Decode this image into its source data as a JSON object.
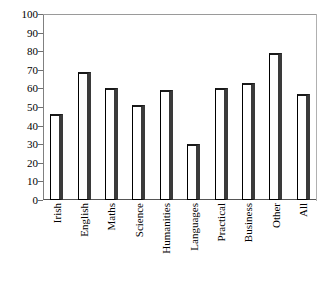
{
  "figure": {
    "caption_remnant": ""
  },
  "chart_data": {
    "type": "bar",
    "title": "",
    "xlabel": "",
    "ylabel": "",
    "categories": [
      "Irish",
      "English",
      "Maths",
      "Science",
      "Humanities",
      "Languages",
      "Practical",
      "Business",
      "Other",
      "All"
    ],
    "values": [
      46,
      69,
      60,
      51,
      59,
      30,
      60,
      63,
      79,
      57
    ],
    "ylim": [
      0,
      100
    ],
    "ytick_labels": [
      "100",
      "90",
      "80",
      "70",
      "60",
      "50",
      "40",
      "30",
      "20",
      "10",
      "0"
    ],
    "ytick_values": [
      100,
      90,
      80,
      70,
      60,
      50,
      40,
      30,
      20,
      10,
      0
    ],
    "grid": false,
    "legend": "none",
    "bar_fill_color": "#ffffff",
    "bar_edge_color": "#000000",
    "bar_shadow_color": "#3a3a3a",
    "axis_color": "#707070"
  }
}
